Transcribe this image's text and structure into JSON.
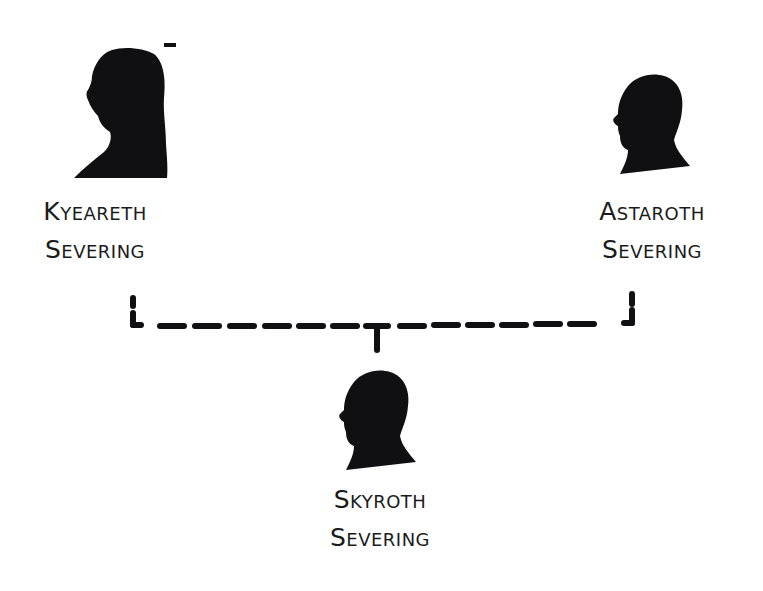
{
  "diagram": {
    "type": "family-tree",
    "colors": {
      "ink": "#101012",
      "text": "#1b1b1d",
      "background": "#ffffff"
    },
    "parents": [
      {
        "id": "kyeareth",
        "first_name": "Kyeareth",
        "last_name": "Severing",
        "icon": "female-silhouette-icon"
      },
      {
        "id": "astaroth",
        "first_name": "Astaroth",
        "last_name": "Severing",
        "icon": "male-silhouette-icon"
      }
    ],
    "child": {
      "id": "skyroth",
      "first_name": "Skyroth",
      "last_name": "Severing",
      "icon": "male-silhouette-icon"
    },
    "connector": {
      "style": "dashed",
      "relation": "parents-to-child"
    }
  }
}
